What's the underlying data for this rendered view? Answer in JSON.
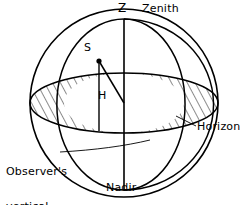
{
  "figure": {
    "kind": "celestial-sphere-diagram",
    "width": 247,
    "height": 205,
    "background_color": "#ffffff",
    "line_color": "#000000",
    "hatch_color": "#000000"
  },
  "labels": {
    "zenith_point": "Z",
    "zenith_name": "Zenith",
    "star_point": "S",
    "altitude_angle": "H",
    "horizon": "Horizon",
    "observers_vertical": "Observer's\nvertical",
    "observers_vertical_line1": "Observer's",
    "observers_vertical_line2": "vertical",
    "nadir": "Nadir"
  },
  "geometry": {
    "sphere_center_x": 124,
    "sphere_center_y": 103,
    "sphere_radius": 94,
    "zenith_x": 124,
    "zenith_y": 19,
    "nadir_x": 124,
    "nadir_y": 190,
    "horizon_rx": 94,
    "horizon_ry": 30,
    "star_x": 99,
    "star_y": 61
  }
}
